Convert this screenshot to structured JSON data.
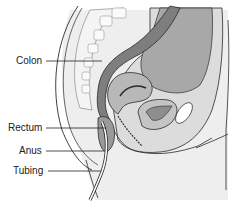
{
  "diagram": {
    "type": "anatomical-sagittal-section",
    "labels": [
      {
        "id": "colon",
        "text": "Colon",
        "x": 16,
        "y": 55,
        "line_from": [
          46,
          61
        ],
        "line_to": [
          102,
          61
        ]
      },
      {
        "id": "rectum",
        "text": "Rectum",
        "x": 8,
        "y": 122,
        "line_from": [
          46,
          128
        ],
        "line_to": [
          106,
          128
        ]
      },
      {
        "id": "anus",
        "text": "Anus",
        "x": 19,
        "y": 145,
        "line_from": [
          46,
          151
        ],
        "line_to": [
          104,
          151
        ]
      },
      {
        "id": "tubing",
        "text": "Tubing",
        "x": 13,
        "y": 165,
        "line_from": [
          48,
          171
        ],
        "line_to": [
          101,
          171
        ]
      }
    ],
    "colors": {
      "background": "#ffffff",
      "outline": "#2a2a2a",
      "colon_fill": "#8a8a8a",
      "organ_dark": "#9a9a9a",
      "organ_mid": "#b4b4b4",
      "tissue_light": "#d8d8d8",
      "tissue_lighter": "#e6e6e6",
      "bone": "#f0f0f0",
      "label_text": "#222222"
    }
  }
}
